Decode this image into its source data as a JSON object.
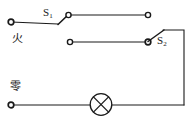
{
  "figure": {
    "kind": "electrical-circuit-schematic",
    "width": 195,
    "height": 121,
    "background_color": "#ffffff",
    "line_color": "#1a1a1a"
  },
  "labels": {
    "switch_one": "S",
    "switch_one_sub": "1",
    "switch_two": "S",
    "switch_two_sub": "2",
    "live_wire": "火",
    "neutral_wire": "零"
  },
  "components": {
    "lamp": {
      "name": "lamp",
      "symbol": "circle-with-x",
      "center_x": 101,
      "center_y": 104,
      "radius": 11
    },
    "switch_one": {
      "name": "switch-s1",
      "state": "open",
      "pivot_x": 58,
      "pivot_y": 24,
      "contact_x": 68,
      "contact_y": 15
    },
    "switch_two": {
      "name": "switch-s2",
      "state": "open",
      "pivot_x": 148,
      "pivot_y": 42,
      "blade_tip_x": 164,
      "blade_tip_y": 30
    }
  },
  "terminals": [
    {
      "name": "terminal-live-left",
      "x": 11,
      "y": 22
    },
    {
      "name": "terminal-s1-contact",
      "x": 68,
      "y": 15
    },
    {
      "name": "terminal-top-right",
      "x": 148,
      "y": 15
    },
    {
      "name": "terminal-middle-left",
      "x": 70,
      "y": 42
    },
    {
      "name": "terminal-s2-pivot",
      "x": 148,
      "y": 42
    },
    {
      "name": "terminal-neutral-left",
      "x": 11,
      "y": 105
    }
  ],
  "wires": [
    {
      "name": "wire-live-to-s1",
      "path": "M 11 22 L 58 24"
    },
    {
      "name": "wire-s1-to-top-right",
      "path": "M 68 15 L 148 15"
    },
    {
      "name": "wire-middle-to-s2",
      "path": "M 70 42 L 148 42"
    },
    {
      "name": "wire-s2-to-right-rail",
      "path": "M 164 30 L 184 30"
    },
    {
      "name": "wire-right-rail-vertical",
      "path": "M 184 30 L 184 105"
    },
    {
      "name": "wire-neutral-to-lamp",
      "path": "M 11 105 L 90 105"
    },
    {
      "name": "wire-lamp-to-right-rail",
      "path": "M 112 105 L 184 105"
    }
  ]
}
